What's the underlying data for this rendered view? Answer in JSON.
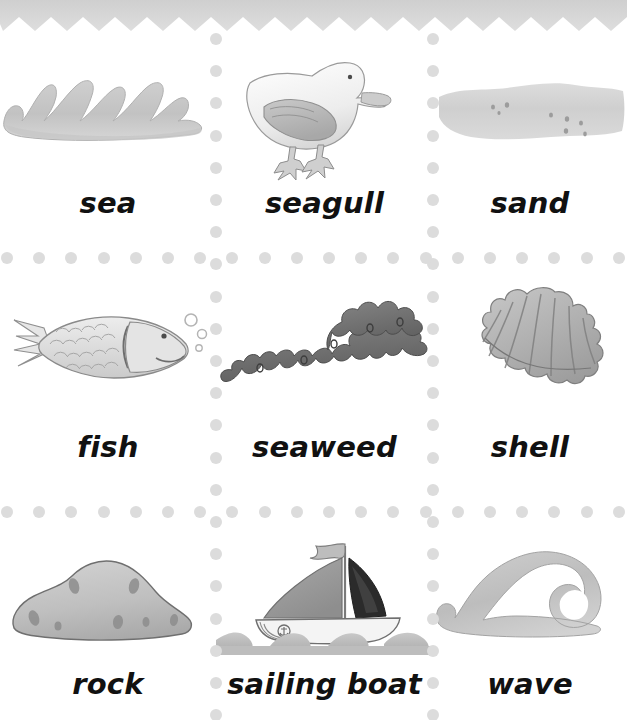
{
  "page": {
    "background_color": "#ffffff",
    "torn_edge_color": "#d5d5d5",
    "dot_color": "#dcdcdc",
    "label_text_color": "#111111",
    "illustration_gray": "#b9b9b9",
    "illustration_dark_gray": "#6e6e6e"
  },
  "grid": {
    "columns": 3,
    "rows": 3,
    "cells": [
      {
        "id": "cell-sea",
        "label": "sea",
        "icon": "ocean-waves-icon",
        "row": 0,
        "column": 0
      },
      {
        "id": "cell-seagull",
        "label": "seagull",
        "icon": "seagull-bird-icon",
        "row": 0,
        "column": 1
      },
      {
        "id": "cell-sand",
        "label": "sand",
        "icon": "sand-patch-icon",
        "row": 0,
        "column": 2
      },
      {
        "id": "cell-fish",
        "label": "fish",
        "icon": "fish-icon",
        "row": 1,
        "column": 0
      },
      {
        "id": "cell-seaweed",
        "label": "seaweed",
        "icon": "seaweed-frond-icon",
        "row": 1,
        "column": 1
      },
      {
        "id": "cell-shell",
        "label": "shell",
        "icon": "scallop-shell-icon",
        "row": 1,
        "column": 2
      },
      {
        "id": "cell-rock",
        "label": "rock",
        "icon": "rock-boulder-icon",
        "row": 2,
        "column": 0
      },
      {
        "id": "cell-sailing-boat",
        "label": "sailing boat",
        "icon": "sailing-boat-icon",
        "row": 2,
        "column": 1
      },
      {
        "id": "cell-wave",
        "label": "wave",
        "icon": "curling-wave-icon",
        "row": 2,
        "column": 2
      }
    ]
  }
}
